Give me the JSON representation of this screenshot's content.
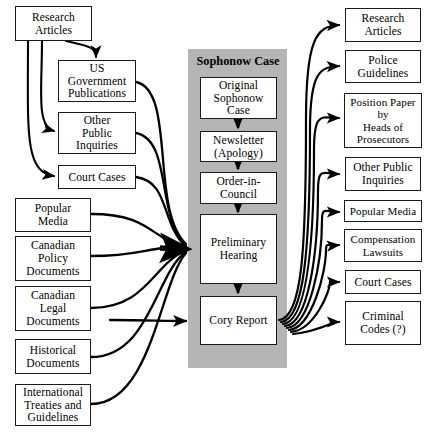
{
  "diagram": {
    "panel": {
      "label": "Sophonow Case",
      "color": "#b5b5b5"
    },
    "colors": {
      "box_border": "#1a1a1a",
      "box_fill": "#ffffff",
      "arrow": "#000000",
      "panel": "#b5b5b5",
      "background": "#ffffff"
    },
    "inputs": [
      {
        "id": "in-research-articles",
        "label": "Research\nArticles",
        "lines": [
          "Research",
          "Articles"
        ]
      },
      {
        "id": "in-us-gov-pubs",
        "label": "US Government Publications",
        "lines": [
          "US",
          "Government",
          "Publications"
        ]
      },
      {
        "id": "in-other-public-inquiries",
        "label": "Other Public Inquiries",
        "lines": [
          "Other",
          "Public",
          "Inquiries"
        ]
      },
      {
        "id": "in-court-cases",
        "label": "Court Cases",
        "lines": [
          "Court Cases"
        ]
      },
      {
        "id": "in-popular-media",
        "label": "Popular Media",
        "lines": [
          "Popular",
          "Media"
        ]
      },
      {
        "id": "in-canadian-policy-documents",
        "label": "Canadian Policy Documents",
        "lines": [
          "Canadian",
          "Policy",
          "Documents"
        ]
      },
      {
        "id": "in-canadian-legal-documents",
        "label": "Canadian Legal Documents",
        "lines": [
          "Canadian",
          "Legal",
          "Documents"
        ]
      },
      {
        "id": "in-historical-documents",
        "label": "Historical Documents",
        "lines": [
          "Historical",
          "Documents"
        ]
      },
      {
        "id": "in-international-treaties",
        "label": "International Treaties and Guidelines",
        "lines": [
          "International",
          "Treaties and",
          "Guidelines"
        ]
      }
    ],
    "process": [
      {
        "id": "pr-original-sophonow-case",
        "label": "Original Sophonow Case",
        "lines": [
          "Original",
          "Sophonow",
          "Case"
        ]
      },
      {
        "id": "pr-newsletter-apology",
        "label": "Newsletter (Apology)",
        "lines": [
          "Newsletter",
          "(Apology)"
        ]
      },
      {
        "id": "pr-order-in-council",
        "label": "Order-in-Council",
        "lines": [
          "Order-in-",
          "Council"
        ]
      },
      {
        "id": "pr-preliminary-hearing",
        "label": "Preliminary Hearing",
        "lines": [
          "Preliminary",
          "Hearing"
        ]
      },
      {
        "id": "pr-cory-report",
        "label": "Cory Report",
        "lines": [
          "Cory Report"
        ]
      }
    ],
    "outputs": [
      {
        "id": "out-research-articles",
        "label": "Research Articles",
        "lines": [
          "Research",
          "Articles"
        ]
      },
      {
        "id": "out-police-guidelines",
        "label": "Police Guidelines",
        "lines": [
          "Police",
          "Guidelines"
        ]
      },
      {
        "id": "out-position-paper",
        "label": "Position Paper by Heads of Prosecutors",
        "lines": [
          "Position Paper",
          "by",
          "Heads of",
          "Prosecutors"
        ]
      },
      {
        "id": "out-other-public-inquiries",
        "label": "Other Public Inquiries",
        "lines": [
          "Other Public",
          "Inquiries"
        ]
      },
      {
        "id": "out-popular-media",
        "label": "Popular Media",
        "lines": [
          "Popular Media"
        ]
      },
      {
        "id": "out-compensation-lawsuits",
        "label": "Compensation Lawsuits",
        "lines": [
          "Compensation",
          "Lawsuits"
        ]
      },
      {
        "id": "out-court-cases",
        "label": "Court Cases",
        "lines": [
          "Court Cases"
        ]
      },
      {
        "id": "out-criminal-codes",
        "label": "Criminal Codes (?)",
        "lines": [
          "Criminal",
          "Codes (?)"
        ]
      }
    ]
  }
}
